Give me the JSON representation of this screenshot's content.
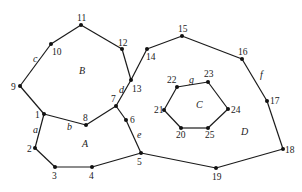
{
  "diagram": {
    "type": "planar-graph",
    "nodes": [
      {
        "id": "1",
        "x": 44,
        "y": 114,
        "lx": 35,
        "ly": 118
      },
      {
        "id": "2",
        "x": 35,
        "y": 148,
        "lx": 27,
        "ly": 152
      },
      {
        "id": "3",
        "x": 55,
        "y": 167,
        "lx": 52,
        "ly": 179
      },
      {
        "id": "4",
        "x": 92,
        "y": 167,
        "lx": 89,
        "ly": 179
      },
      {
        "id": "5",
        "x": 141,
        "y": 153,
        "lx": 137,
        "ly": 165
      },
      {
        "id": "6",
        "x": 126,
        "y": 120,
        "lx": 130,
        "ly": 123
      },
      {
        "id": "7",
        "x": 116,
        "y": 106,
        "lx": 111,
        "ly": 102
      },
      {
        "id": "8",
        "x": 86,
        "y": 125,
        "lx": 83,
        "ly": 121
      },
      {
        "id": "9",
        "x": 20,
        "y": 86,
        "lx": 11,
        "ly": 90
      },
      {
        "id": "10",
        "x": 51,
        "y": 44,
        "lx": 52,
        "ly": 55
      },
      {
        "id": "11",
        "x": 81,
        "y": 25,
        "lx": 77,
        "ly": 21
      },
      {
        "id": "12",
        "x": 122,
        "y": 49,
        "lx": 118,
        "ly": 46
      },
      {
        "id": "13",
        "x": 131,
        "y": 80,
        "lx": 132,
        "ly": 92
      },
      {
        "id": "14",
        "x": 147,
        "y": 49,
        "lx": 146,
        "ly": 60
      },
      {
        "id": "15",
        "x": 182,
        "y": 36,
        "lx": 178,
        "ly": 32
      },
      {
        "id": "16",
        "x": 242,
        "y": 59,
        "lx": 238,
        "ly": 55
      },
      {
        "id": "17",
        "x": 267,
        "y": 101,
        "lx": 270,
        "ly": 104
      },
      {
        "id": "18",
        "x": 283,
        "y": 149,
        "lx": 285,
        "ly": 153
      },
      {
        "id": "19",
        "x": 216,
        "y": 168,
        "lx": 212,
        "ly": 180
      },
      {
        "id": "20",
        "x": 181,
        "y": 128,
        "lx": 176,
        "ly": 138
      },
      {
        "id": "21",
        "x": 164,
        "y": 110,
        "lx": 154,
        "ly": 113
      },
      {
        "id": "22",
        "x": 177,
        "y": 87,
        "lx": 167,
        "ly": 83
      },
      {
        "id": "23",
        "x": 208,
        "y": 82,
        "lx": 204,
        "ly": 77
      },
      {
        "id": "24",
        "x": 228,
        "y": 109,
        "lx": 231,
        "ly": 113
      },
      {
        "id": "25",
        "x": 208,
        "y": 128,
        "lx": 205,
        "ly": 138
      }
    ],
    "edges": [
      [
        "1",
        "2"
      ],
      [
        "2",
        "3"
      ],
      [
        "3",
        "4"
      ],
      [
        "4",
        "5"
      ],
      [
        "5",
        "6"
      ],
      [
        "6",
        "7"
      ],
      [
        "7",
        "8"
      ],
      [
        "8",
        "1"
      ],
      [
        "1",
        "9"
      ],
      [
        "9",
        "10"
      ],
      [
        "10",
        "11"
      ],
      [
        "11",
        "12"
      ],
      [
        "12",
        "13"
      ],
      [
        "13",
        "7"
      ],
      [
        "13",
        "14"
      ],
      [
        "14",
        "15"
      ],
      [
        "15",
        "16"
      ],
      [
        "16",
        "17"
      ],
      [
        "17",
        "18"
      ],
      [
        "18",
        "19"
      ],
      [
        "19",
        "5"
      ],
      [
        "20",
        "21"
      ],
      [
        "21",
        "22"
      ],
      [
        "22",
        "23"
      ],
      [
        "23",
        "24"
      ],
      [
        "24",
        "25"
      ],
      [
        "25",
        "20"
      ]
    ],
    "region_labels": [
      {
        "text": "A",
        "x": 82,
        "y": 147
      },
      {
        "text": "B",
        "x": 79,
        "y": 74
      },
      {
        "text": "C",
        "x": 196,
        "y": 108
      },
      {
        "text": "D",
        "x": 241,
        "y": 135
      }
    ],
    "edge_labels": [
      {
        "text": "a",
        "x": 33,
        "y": 133
      },
      {
        "text": "b",
        "x": 67,
        "y": 130
      },
      {
        "text": "c",
        "x": 33,
        "y": 62
      },
      {
        "text": "d",
        "x": 119,
        "y": 93
      },
      {
        "text": "e",
        "x": 137,
        "y": 138
      },
      {
        "text": "f",
        "x": 260,
        "y": 78
      },
      {
        "text": "g",
        "x": 189,
        "y": 83
      }
    ]
  }
}
